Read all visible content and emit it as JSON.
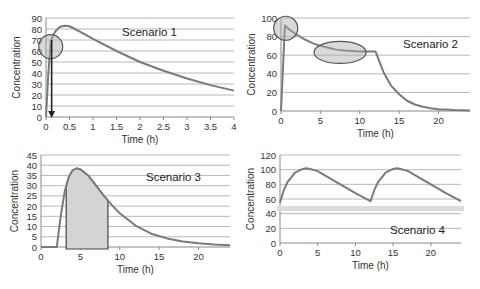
{
  "chart_data": [
    {
      "type": "line",
      "title": "Scenario 1",
      "xlabel": "Time (h)",
      "ylabel": "Concentration",
      "xlim": [
        0,
        4
      ],
      "ylim": [
        0,
        90
      ],
      "xticks": [
        0,
        0.5,
        1,
        1.5,
        2,
        2.5,
        3,
        3.5,
        4
      ],
      "xtick_labels": [
        "0",
        "0.5",
        "1",
        "1.5",
        "2",
        "2.5",
        "3",
        "3.5",
        "4"
      ],
      "yticks": [
        0,
        10,
        20,
        30,
        40,
        50,
        60,
        70,
        80,
        90
      ],
      "grid": true,
      "series": [
        {
          "name": "Concentration",
          "x": [
            0,
            0.05,
            0.1,
            0.15,
            0.2,
            0.3,
            0.4,
            0.5,
            0.75,
            1,
            1.5,
            2,
            2.5,
            3,
            3.5,
            4
          ],
          "y": [
            0,
            40,
            68,
            74,
            78,
            82,
            83,
            82.5,
            77,
            71,
            60,
            50,
            42,
            35,
            29,
            24
          ]
        }
      ],
      "annotations": [
        {
          "type": "circle",
          "label": "early-concentration-highlight",
          "cx": 0.1,
          "cy": 64,
          "note": "shaded circle around rising phase"
        },
        {
          "type": "arrow",
          "label": "time-marker-arrow",
          "from": [
            0.12,
            70
          ],
          "to": [
            0.12,
            0
          ],
          "note": "vertical arrow pointing down to x-axis"
        }
      ]
    },
    {
      "type": "line",
      "title": "Scenario 2",
      "xlabel": "Time (h)",
      "ylabel": "Concentration",
      "xlim": [
        0,
        24
      ],
      "ylim": [
        0,
        100
      ],
      "xticks": [
        0,
        5,
        10,
        15,
        20
      ],
      "xtick_labels": [
        "0",
        "5",
        "10",
        "15",
        "20"
      ],
      "yticks": [
        0,
        20,
        40,
        60,
        80,
        100
      ],
      "grid": true,
      "series": [
        {
          "name": "Concentration",
          "x": [
            0,
            0.5,
            1,
            2,
            3,
            4,
            5,
            6,
            7,
            8,
            9,
            10,
            11,
            12,
            13,
            14,
            15,
            16,
            17,
            18,
            19,
            20,
            22,
            24
          ],
          "y": [
            0,
            92,
            88,
            82,
            77,
            73,
            70,
            68,
            66,
            65,
            64.5,
            64,
            64,
            64,
            42,
            27,
            18,
            11,
            7,
            4.5,
            3,
            2,
            1,
            0.5
          ]
        }
      ],
      "annotations": [
        {
          "type": "circle",
          "label": "peak-highlight",
          "cx": 0.6,
          "cy": 89
        },
        {
          "type": "ellipse",
          "label": "plateau-highlight",
          "cx": 7.5,
          "cy": 63,
          "rx": 3.3,
          "ry": 10
        }
      ]
    },
    {
      "type": "area",
      "title": "Scenario 3",
      "xlabel": "Time (h)",
      "ylabel": "Concentration",
      "xlim": [
        0,
        24
      ],
      "ylim": [
        0,
        45
      ],
      "xticks": [
        0,
        5,
        10,
        15,
        20
      ],
      "xtick_labels": [
        "0",
        "5",
        "10",
        "15",
        "20"
      ],
      "yticks": [
        0,
        5,
        10,
        15,
        20,
        25,
        30,
        35,
        40,
        45
      ],
      "grid": true,
      "series": [
        {
          "name": "Concentration",
          "x": [
            0,
            2,
            2.5,
            3,
            3.5,
            4,
            4.5,
            5,
            6,
            7,
            8,
            9,
            10,
            12,
            14,
            16,
            18,
            20,
            22,
            24
          ],
          "y": [
            0,
            0,
            15,
            27,
            34,
            37.5,
            38.5,
            38,
            35,
            30,
            25,
            20.5,
            16.5,
            10.5,
            6.5,
            4.2,
            2.7,
            1.8,
            1.2,
            0.8
          ]
        }
      ],
      "annotations": [
        {
          "type": "shaded-area",
          "label": "auc-region",
          "x_from": 3.2,
          "x_to": 8.5
        }
      ]
    },
    {
      "type": "line",
      "title": "Scenario 4",
      "xlabel": "Time (h)",
      "ylabel": "Concentration",
      "xlim": [
        0,
        24
      ],
      "ylim": [
        0,
        120
      ],
      "xticks": [
        0,
        5,
        10,
        15,
        20
      ],
      "xtick_labels": [
        "0",
        "5",
        "10",
        "15",
        "20"
      ],
      "yticks": [
        0,
        20,
        40,
        60,
        80,
        100,
        120
      ],
      "grid": true,
      "series": [
        {
          "name": "Concentration",
          "x": [
            0,
            0.5,
            1,
            2,
            3,
            3.5,
            4,
            5,
            6,
            8,
            10,
            12,
            12.5,
            13,
            14,
            15,
            15.5,
            16,
            17,
            18,
            20,
            22,
            24
          ],
          "y": [
            55,
            72,
            83,
            96,
            101,
            102,
            101,
            98,
            92,
            80,
            68,
            57,
            72,
            83,
            96,
            101,
            102,
            101,
            98,
            92,
            80,
            68,
            57
          ]
        }
      ],
      "annotations": [
        {
          "type": "threshold-band",
          "label": "minimum-effective-concentration",
          "y": 47,
          "note": "light gray horizontal band"
        }
      ]
    }
  ]
}
